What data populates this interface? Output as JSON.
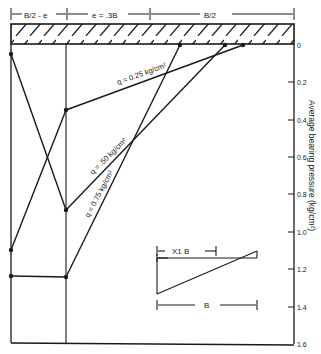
{
  "diagram": {
    "dimensions": {
      "left": "B/2 - e",
      "middle": "e = .3B",
      "right": "B/2"
    },
    "axis": {
      "title": "Average bearing pressure (kg/cm²)",
      "ticks": [
        "0",
        "0.2",
        "0.4",
        "0.6",
        "0.8",
        "1.0",
        "1.2",
        "1.4",
        "1.6"
      ]
    },
    "curves": [
      {
        "label": "q = 0.25 kg/cm²"
      },
      {
        "label": "q = .50 kg/cm²"
      },
      {
        "label": "q = 0.75 kg/cm²"
      }
    ],
    "inset": {
      "x_label": "X1 B",
      "width_label": "B"
    }
  }
}
